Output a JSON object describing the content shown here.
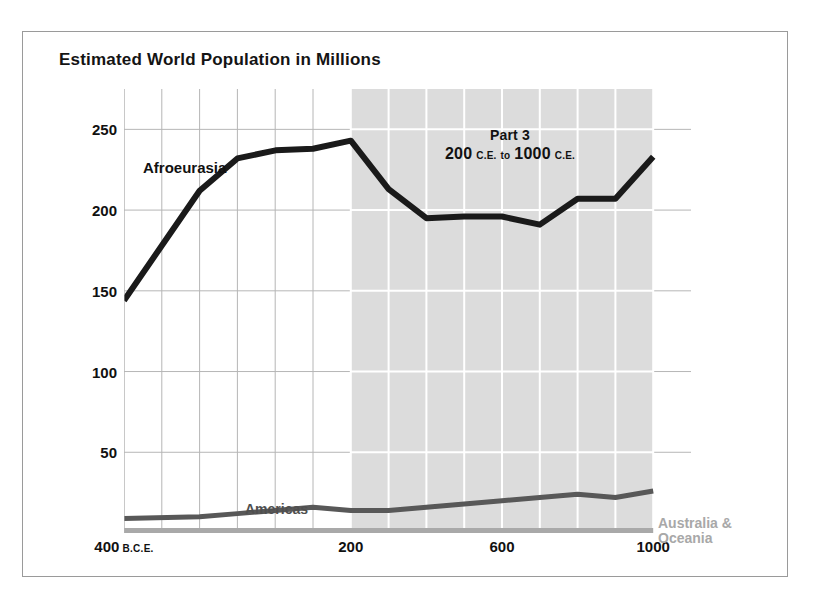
{
  "figure": {
    "title": "Estimated World Population in Millions",
    "annotation": {
      "part_title": "Part 3",
      "range_from": "200",
      "range_from_era": "C.E.",
      "range_joiner": "to",
      "range_to": "1000",
      "range_to_era": "C.E."
    },
    "labels": {
      "afroeurasia": "Afroeurasia",
      "americas": "Americas",
      "australia_line1": "Australia &",
      "australia_line2": "Oceania"
    },
    "colors": {
      "afroeurasia": "#1a1a1a",
      "americas": "#585858",
      "australia": "#a9a9a9",
      "shaded_band": "#dcdcdc",
      "gridline": "#b6b6b6",
      "gridline_shaded": "#ffffff",
      "frame": "#9a9a9a",
      "background": "#ffffff"
    }
  },
  "chart_data": {
    "type": "line",
    "title": "Estimated World Population in Millions",
    "xlabel": "",
    "ylabel": "Population (millions)",
    "xlim": [
      -400,
      1100
    ],
    "ylim": [
      0,
      275
    ],
    "yticks": [
      50,
      100,
      150,
      200,
      250
    ],
    "ytick_labels": [
      "50",
      "100",
      "150",
      "200",
      "250"
    ],
    "xticks": [
      -400,
      200,
      600,
      1000
    ],
    "xtick_labels": [
      "400 B.C.E.",
      "200",
      "600",
      "1000"
    ],
    "xtick_main": [
      "400",
      "200",
      "600",
      "1000"
    ],
    "xtick_era": [
      "B.C.E.",
      "",
      "",
      ""
    ],
    "grid": true,
    "legend": "inline-annotations",
    "highlight_band": {
      "label": "Part 3",
      "x_start": 200,
      "x_end": 1000,
      "note": "200 C.E. to 1000 C.E."
    },
    "x": [
      -400,
      -200,
      -100,
      1,
      100,
      200,
      300,
      400,
      500,
      600,
      700,
      800,
      900,
      1000
    ],
    "series": [
      {
        "name": "Afroeurasia",
        "color": "#1a1a1a",
        "values": [
          144,
          212,
          232,
          237,
          238,
          243,
          213,
          195,
          196,
          196,
          191,
          207,
          207,
          233
        ]
      },
      {
        "name": "Americas",
        "color": "#585858",
        "values": [
          9,
          10,
          12,
          14,
          16,
          14,
          14,
          16,
          18,
          20,
          22,
          24,
          22,
          26
        ]
      },
      {
        "name": "Australia & Oceania",
        "color": "#a9a9a9",
        "values": [
          1,
          1,
          1,
          1,
          1,
          1,
          1,
          1,
          1,
          1,
          1,
          1,
          1,
          1
        ]
      }
    ]
  }
}
